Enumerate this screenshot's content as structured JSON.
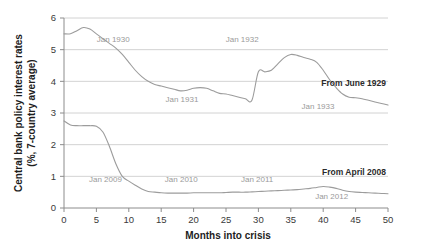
{
  "chart_data": {
    "type": "line",
    "title": "",
    "xlabel": "Months into crisis",
    "ylabel": "Central bank policy interest rates\n(%, 7-country average)",
    "ylabel_line1": "Central bank policy interest rates",
    "ylabel_line2": "(%, 7-country average)",
    "xlim": [
      0,
      50
    ],
    "ylim": [
      0,
      6
    ],
    "xticks": [
      0,
      5,
      10,
      15,
      20,
      25,
      30,
      35,
      40,
      45,
      50
    ],
    "xtick_labels": [
      "0",
      "5",
      "10",
      "15",
      "20",
      "25",
      "30",
      "35",
      "40",
      "45",
      "50"
    ],
    "yticks": [
      0,
      1,
      2,
      3,
      4,
      5,
      6
    ],
    "ytick_labels": [
      "0",
      "1",
      "2",
      "3",
      "4",
      "5",
      "6"
    ],
    "grid": "horizontal",
    "legend_position": "inline-right",
    "series": [
      {
        "name": "From June 1929",
        "label": "From June 1929",
        "color": "#9c9c9c",
        "x": [
          0,
          1,
          2,
          3,
          4,
          5,
          6,
          7,
          8,
          9,
          10,
          11,
          12,
          13,
          14,
          15,
          16,
          17,
          18,
          19,
          20,
          21,
          22,
          23,
          24,
          25,
          26,
          27,
          28,
          29,
          30,
          31,
          32,
          33,
          34,
          35,
          36,
          37,
          38,
          39,
          40,
          41,
          42,
          43,
          44,
          45,
          46,
          47,
          48,
          49,
          50
        ],
        "values": [
          5.5,
          5.5,
          5.6,
          5.7,
          5.65,
          5.5,
          5.35,
          5.2,
          5.05,
          4.85,
          4.6,
          4.35,
          4.15,
          4.0,
          3.9,
          3.85,
          3.8,
          3.75,
          3.7,
          3.72,
          3.78,
          3.8,
          3.78,
          3.7,
          3.62,
          3.6,
          3.55,
          3.5,
          3.45,
          3.4,
          4.3,
          4.3,
          4.35,
          4.55,
          4.75,
          4.85,
          4.82,
          4.75,
          4.7,
          4.6,
          4.35,
          4.05,
          3.8,
          3.6,
          3.5,
          3.48,
          3.45,
          3.4,
          3.35,
          3.3,
          3.25
        ]
      },
      {
        "name": "From April 2008",
        "label": "From April 2008",
        "color": "#b0b0b0",
        "x": [
          0,
          1,
          2,
          3,
          4,
          5,
          6,
          7,
          8,
          9,
          10,
          11,
          12,
          13,
          14,
          15,
          16,
          17,
          18,
          19,
          20,
          21,
          22,
          23,
          24,
          25,
          26,
          27,
          28,
          29,
          30,
          31,
          32,
          33,
          34,
          35,
          36,
          37,
          38,
          39,
          40,
          41,
          42,
          43,
          44,
          45,
          46,
          47,
          48,
          49,
          50
        ],
        "values": [
          2.75,
          2.62,
          2.6,
          2.6,
          2.6,
          2.58,
          2.4,
          1.95,
          1.4,
          1.0,
          0.85,
          0.72,
          0.6,
          0.52,
          0.5,
          0.48,
          0.47,
          0.47,
          0.47,
          0.47,
          0.48,
          0.48,
          0.48,
          0.48,
          0.48,
          0.49,
          0.5,
          0.5,
          0.5,
          0.51,
          0.52,
          0.53,
          0.54,
          0.55,
          0.56,
          0.57,
          0.58,
          0.6,
          0.62,
          0.65,
          0.68,
          0.66,
          0.62,
          0.56,
          0.52,
          0.5,
          0.49,
          0.48,
          0.47,
          0.46,
          0.45
        ]
      }
    ],
    "annotations": [
      {
        "text": "Jan 1930",
        "x": 7.6,
        "y": 5.25,
        "series": "From June 1929"
      },
      {
        "text": "Jan 1931",
        "x": 18.2,
        "y": 3.35,
        "series": "From June 1929"
      },
      {
        "text": "Jan 1932",
        "x": 27.5,
        "y": 5.25,
        "series": "From June 1929"
      },
      {
        "text": "Jan 1933",
        "x": 39.2,
        "y": 3.12,
        "series": "From June 1929"
      },
      {
        "text": "Jan 2009",
        "x": 6.4,
        "y": 0.82,
        "series": "From April 2008"
      },
      {
        "text": "Jan 2010",
        "x": 18.1,
        "y": 0.82,
        "series": "From April 2008"
      },
      {
        "text": "Jan 2011",
        "x": 29.8,
        "y": 0.82,
        "series": "From April 2008"
      },
      {
        "text": "Jan 2012",
        "x": 41.3,
        "y": 0.27,
        "series": "From April 2008"
      }
    ]
  }
}
